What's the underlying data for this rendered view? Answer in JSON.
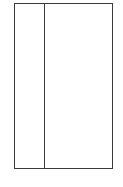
{
  "figure": {
    "kind": "two-column-frame",
    "background_color": "#ffffff",
    "border_color": "#3b3b3b",
    "fill_color": "#ffffff",
    "columns": [
      {
        "name": "left-column",
        "text": ""
      },
      {
        "name": "right-column",
        "text": ""
      }
    ]
  }
}
